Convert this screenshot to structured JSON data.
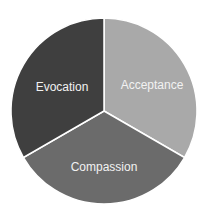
{
  "chart_data": {
    "type": "pie",
    "title": "",
    "categories": [
      "Acceptance",
      "Compassion",
      "Evocation"
    ],
    "values": [
      33.3,
      33.3,
      33.3
    ],
    "colors": [
      "#a9a9a9",
      "#6b6b6b",
      "#3f3f3f"
    ],
    "start_angle_deg": 0,
    "direction": "clockwise",
    "legend": "none",
    "data_labels": "inside"
  },
  "slices": [
    {
      "label": "Acceptance",
      "color": "#a9a9a9"
    },
    {
      "label": "Compassion",
      "color": "#6b6b6b"
    },
    {
      "label": "Evocation",
      "color": "#3f3f3f"
    }
  ],
  "geometry": {
    "cx": 104,
    "cy": 111,
    "r": 93
  },
  "separator_color": "#ffffff"
}
